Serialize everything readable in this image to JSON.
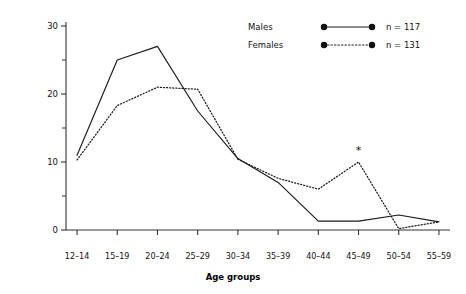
{
  "chart_data": {
    "type": "line",
    "title": "",
    "xlabel": "Age groups",
    "ylabel": "Percentage of total onsets per 5-year age group",
    "categories": [
      "12–14",
      "15–19",
      "20–24",
      "25–29",
      "30–34",
      "35–39",
      "40–44",
      "45–49",
      "50–54",
      "55–59"
    ],
    "ylim": [
      0,
      30
    ],
    "yticks": [
      0,
      10,
      20,
      30
    ],
    "ytick_labels": [
      "0",
      "10",
      "20",
      "30"
    ],
    "yminor_ticks": [
      5,
      15,
      25
    ],
    "grid": false,
    "legend_position": "top-right",
    "series": [
      {
        "name": "Males",
        "n_label": "n = 117",
        "n_value": 117,
        "style": "solid",
        "color": "#1a1a1a",
        "values": [
          11.0,
          25.0,
          27.0,
          17.5,
          10.5,
          7.0,
          1.3,
          1.3,
          2.2,
          1.2
        ]
      },
      {
        "name": "Females",
        "n_label": "n = 131",
        "n_value": 131,
        "style": "dotted",
        "color": "#1a1a1a",
        "values": [
          10.3,
          18.3,
          21.0,
          20.7,
          10.4,
          7.6,
          6.0,
          10.0,
          0.2,
          1.2
        ]
      }
    ],
    "annotations": [
      {
        "text": "*",
        "category": "45–49",
        "series": "Females",
        "value": 10.0
      }
    ]
  },
  "legend": {
    "rows": [
      {
        "label": "Males",
        "n": "n = 117",
        "style": "solid"
      },
      {
        "label": "Females",
        "n": "n = 131",
        "style": "dotted"
      }
    ]
  },
  "axes": {
    "x_title": "Age groups",
    "y_title": "Percentage of total onsets per 5-year age group"
  }
}
